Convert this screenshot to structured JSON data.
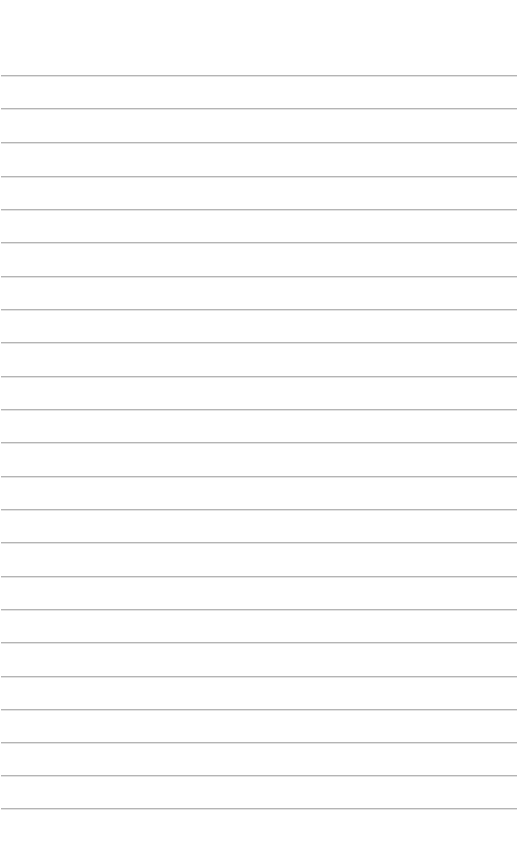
{
  "page": {
    "type": "lined-paper",
    "background_color": "#ffffff",
    "line_color": "#b4b4b4",
    "text": ""
  },
  "lines": [
    {
      "y": 75
    },
    {
      "y": 108
    },
    {
      "y": 142
    },
    {
      "y": 176
    },
    {
      "y": 209
    },
    {
      "y": 242
    },
    {
      "y": 276
    },
    {
      "y": 309
    },
    {
      "y": 342
    },
    {
      "y": 376
    },
    {
      "y": 409
    },
    {
      "y": 442
    },
    {
      "y": 476
    },
    {
      "y": 509
    },
    {
      "y": 542
    },
    {
      "y": 576
    },
    {
      "y": 609
    },
    {
      "y": 642
    },
    {
      "y": 676
    },
    {
      "y": 709
    },
    {
      "y": 742
    },
    {
      "y": 775
    },
    {
      "y": 808
    }
  ]
}
